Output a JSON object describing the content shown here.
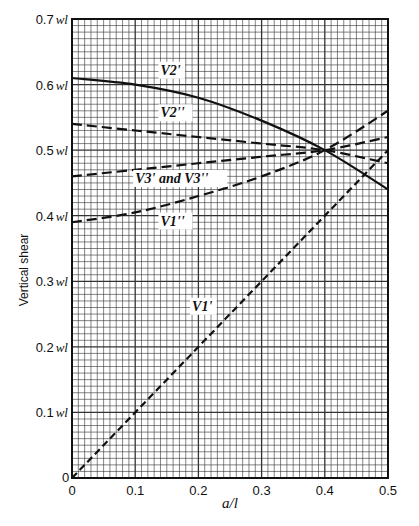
{
  "chart_data": {
    "type": "line",
    "title": "",
    "xlabel": "a/l",
    "ylabel": "Vertical shear",
    "xlim": [
      0,
      0.5
    ],
    "ylim": [
      0,
      0.7
    ],
    "grid": true,
    "x_ticks": [
      "0",
      "0.1",
      "0.2",
      "0.3",
      "0.4",
      "0.5"
    ],
    "y_ticks": [
      "0",
      "0.1 wl",
      "0.2 wl",
      "0.3 wl",
      "0.4 wl",
      "0.5 wl",
      "0.6 wl",
      "0.7 wl"
    ],
    "x": [
      0,
      0.1,
      0.2,
      0.3,
      0.4,
      0.5
    ],
    "series": [
      {
        "name": "V2'",
        "style": "solid",
        "values": [
          0.61,
          0.6,
          0.58,
          0.545,
          0.5,
          0.44
        ]
      },
      {
        "name": "V2''",
        "style": "dashed",
        "values": [
          0.54,
          0.53,
          0.52,
          0.51,
          0.5,
          0.48
        ]
      },
      {
        "name": "V3' and V3''",
        "style": "dashed",
        "values": [
          0.46,
          0.47,
          0.48,
          0.49,
          0.5,
          0.52
        ]
      },
      {
        "name": "V1''",
        "style": "dashed",
        "values": [
          0.39,
          0.405,
          0.43,
          0.46,
          0.5,
          0.56
        ]
      },
      {
        "name": "V1'",
        "style": "dash-dot",
        "values": [
          0,
          0.125,
          0.25,
          0.375,
          0.5,
          0.625
        ]
      }
    ],
    "annotations": [
      {
        "text": "V2'",
        "x": 0.14,
        "y": 0.615
      },
      {
        "text": "V2''",
        "x": 0.14,
        "y": 0.55
      },
      {
        "text": "V3' and V3''",
        "x": 0.1,
        "y": 0.45
      },
      {
        "text": "V1''",
        "x": 0.14,
        "y": 0.385
      },
      {
        "text": "V1'",
        "x": 0.19,
        "y": 0.255
      }
    ]
  },
  "labels": {
    "xlabel": "a/l",
    "ylabel": "Vertical shear",
    "origin": "0",
    "v2p": "V2'",
    "v2pp": "V2''",
    "v3": "V3' and V3''",
    "v1pp": "V1''",
    "v1p": "V1'"
  }
}
